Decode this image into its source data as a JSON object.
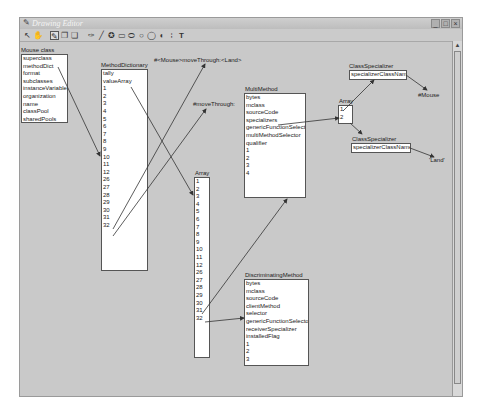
{
  "window": {
    "title": "Drawing Editor",
    "controls": [
      "minimize",
      "maximize",
      "close"
    ]
  },
  "toolbar": {
    "tools": [
      {
        "name": "select-tool-icon",
        "glyph": "↖"
      },
      {
        "name": "hand-tool-icon",
        "glyph": "✋"
      },
      {
        "name": "pencil-tool-icon",
        "glyph": "✎",
        "active": true
      },
      {
        "name": "copy-tool-icon",
        "glyph": "❐"
      },
      {
        "name": "paste-tool-icon",
        "glyph": "❏"
      },
      {
        "name": "pen-tool-icon",
        "glyph": "✑"
      },
      {
        "name": "line-tool-icon",
        "glyph": "╱"
      },
      {
        "name": "fill-tool-icon",
        "glyph": "✪"
      },
      {
        "name": "rectangle-tool-icon",
        "glyph": "▭"
      },
      {
        "name": "rounded-rect-tool-icon",
        "glyph": "⬭"
      },
      {
        "name": "ellipse-tool-icon",
        "glyph": "○"
      },
      {
        "name": "circle-tool-icon",
        "glyph": "◯"
      },
      {
        "name": "arc-tool-icon",
        "glyph": "◖"
      },
      {
        "name": "grid-tool-icon",
        "glyph": "⁞"
      },
      {
        "name": "text-tool-icon",
        "glyph": "T"
      }
    ]
  },
  "objects": {
    "mouse_class": {
      "label": "Mouse class",
      "slots": [
        "superclass",
        "methodDict",
        "format",
        "subclasses",
        "instanceVariables",
        "organization",
        "name",
        "classPool",
        "sharedPools"
      ]
    },
    "method_dictionary": {
      "label": "MethodDictionary",
      "slots": [
        "tally",
        "valueArray",
        "1",
        "2",
        "3",
        "4",
        "5",
        "6",
        "7",
        "8",
        "9",
        "10",
        "11",
        "12",
        "26",
        "27",
        "28",
        "29",
        "30",
        "31",
        "32"
      ]
    },
    "array_main": {
      "label": "Array",
      "slots": [
        "1",
        "2",
        "3",
        "4",
        "5",
        "6",
        "7",
        "8",
        "9",
        "10",
        "11",
        "12",
        "26",
        "27",
        "28",
        "29",
        "30",
        "31",
        "32"
      ]
    },
    "multi_method": {
      "label": "MultiMethod",
      "slots": [
        "bytes",
        "mclass",
        "sourceCode",
        "specializers",
        "genericFunctionSelector",
        "multiMethodSelector",
        "qualifier",
        "1",
        "2",
        "3",
        "4"
      ]
    },
    "array_small": {
      "label": "Array",
      "slots": [
        "1",
        "2"
      ]
    },
    "class_specializer_1": {
      "label": "ClassSpecializer",
      "slots": [
        "specializerClassName"
      ]
    },
    "class_specializer_2": {
      "label": "ClassSpecializer",
      "slots": [
        "specializerClassName"
      ]
    },
    "discriminating_method": {
      "label": "DiscriminatingMethod",
      "slots": [
        "bytes",
        "mclass",
        "sourceCode",
        "clientMethod",
        "selector",
        "genericFunctionSelector",
        "receiverSpecializer",
        "installedFlag",
        "1",
        "2",
        "3"
      ]
    }
  },
  "symbols": {
    "mouse_move_through_land": "#<Mouse>moveThrough:<Land>",
    "move_through": "#moveThrough:",
    "mouse": "#Mouse",
    "land": "'Land'"
  },
  "colors": {
    "canvas": "#c9c9c9",
    "object_fill": "#ffffff",
    "arrow": "#333333"
  }
}
